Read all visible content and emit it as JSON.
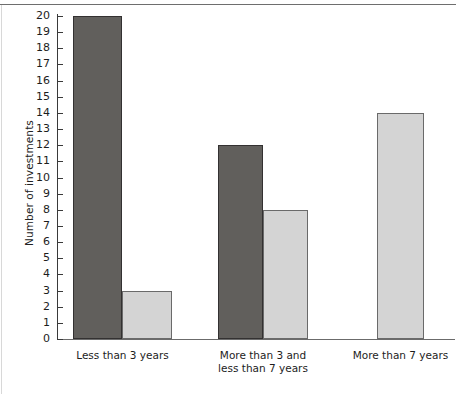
{
  "chart_data": {
    "type": "bar",
    "title": "",
    "xlabel": "",
    "ylabel": "Number of investments",
    "ylim": [
      0,
      20
    ],
    "ytick_step": 1,
    "yticks": [
      0,
      1,
      2,
      3,
      4,
      5,
      6,
      7,
      8,
      9,
      10,
      11,
      12,
      13,
      14,
      15,
      16,
      17,
      18,
      19,
      20
    ],
    "ytick_labels": [
      "0",
      "1",
      "2",
      "3",
      "4",
      "5",
      "6",
      "7",
      "8",
      "9",
      "10",
      "11",
      "12",
      "13",
      "14",
      "15",
      "16",
      "17",
      "18",
      "19",
      "20"
    ],
    "grid": false,
    "legend": null,
    "categories": [
      "Less than 3 years",
      "More than 3 and\nless than 7 years",
      "More than 7 years"
    ],
    "series": [
      {
        "name": "dark-series",
        "color": "#615f5c",
        "values": [
          20,
          12,
          null
        ]
      },
      {
        "name": "light-series",
        "color": "#d4d4d4",
        "values": [
          3,
          8,
          14
        ]
      }
    ],
    "bars": [
      {
        "category": "Less than 3 years",
        "series": "dark-series",
        "value": 20,
        "color": "#615f5c",
        "x": 73,
        "width": 49
      },
      {
        "category": "Less than 3 years",
        "series": "light-series",
        "value": 3,
        "color": "#d4d4d4",
        "x": 122,
        "width": 50
      },
      {
        "category": "More than 3 and\nless than 7 years",
        "series": "dark-series",
        "value": 12,
        "color": "#615f5c",
        "x": 218,
        "width": 45
      },
      {
        "category": "More than 3 and\nless than 7 years",
        "series": "light-series",
        "value": 8,
        "color": "#d4d4d4",
        "x": 263,
        "width": 45
      },
      {
        "category": "More than 7 years",
        "series": "light-series",
        "value": 14,
        "color": "#d4d4d4",
        "x": 377,
        "width": 47
      }
    ],
    "colors": {
      "dark_bar": "#615f5c",
      "light_bar": "#d4d4d4",
      "bar_outline": "#4a4a4a",
      "axis": "#3a3a3a",
      "text": "#1d1d1d",
      "background": "#ffffff"
    }
  }
}
